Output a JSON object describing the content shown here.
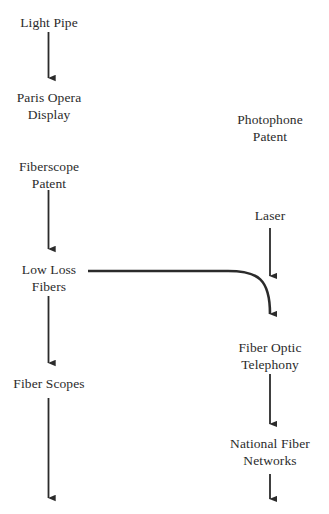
{
  "diagram": {
    "background_color": "#ffffff",
    "line_color": "#2b2b2b",
    "text_color": "#2b2b2b",
    "width": 329,
    "height": 514,
    "nodes": [
      {
        "id": "light-pipe",
        "lines": [
          "Light Pipe"
        ],
        "cx": 49,
        "top": 15
      },
      {
        "id": "paris-opera-display",
        "lines": [
          "Paris Opera",
          "Display"
        ],
        "cx": 49,
        "top": 90
      },
      {
        "id": "photophone-patent",
        "lines": [
          "Photophone",
          "Patent"
        ],
        "cx": 270,
        "top": 112
      },
      {
        "id": "fiberscope-patent",
        "lines": [
          "Fiberscope",
          "Patent"
        ],
        "cx": 49,
        "top": 159
      },
      {
        "id": "laser",
        "lines": [
          "Laser"
        ],
        "cx": 270,
        "top": 208
      },
      {
        "id": "low-loss-fibers",
        "lines": [
          "Low Loss",
          "Fibers"
        ],
        "cx": 49,
        "top": 262
      },
      {
        "id": "fiber-optic-telephony",
        "lines": [
          "Fiber Optic",
          "Telephony"
        ],
        "cx": 270,
        "top": 340
      },
      {
        "id": "fiber-scopes",
        "lines": [
          "Fiber Scopes"
        ],
        "cx": 49,
        "top": 376
      },
      {
        "id": "national-fiber-networks",
        "lines": [
          "National Fiber",
          "Networks"
        ],
        "cx": 270,
        "top": 436
      }
    ],
    "connectors": [
      {
        "id": "light-pipe-to-paris-opera",
        "kind": "arrow-down",
        "x": 48.5,
        "y1": 32,
        "y2": 86
      },
      {
        "id": "fiberscope-patent-to-low-loss",
        "kind": "arrow-down",
        "x": 48.5,
        "y1": 190,
        "y2": 257
      },
      {
        "id": "low-loss-to-fiber-scopes",
        "kind": "arrow-down",
        "x": 48.5,
        "y1": 296,
        "y2": 371
      },
      {
        "id": "fiber-scopes-downward",
        "kind": "arrow-down",
        "x": 48.5,
        "y1": 398,
        "y2": 506
      },
      {
        "id": "laser-to-fiber-optic-telephony",
        "kind": "arrow-down",
        "x": 270,
        "y1": 228,
        "y2": 284
      },
      {
        "id": "low-loss-to-fiber-optic-telephony",
        "kind": "arrow-curve",
        "x1": 88,
        "y1": 271,
        "x2": 270,
        "y2": 322
      },
      {
        "id": "telephony-to-national-networks",
        "kind": "arrow-down",
        "x": 270,
        "y1": 374,
        "y2": 432
      },
      {
        "id": "national-networks-downward",
        "kind": "arrow-down",
        "x": 270,
        "y1": 474,
        "y2": 507
      }
    ]
  }
}
